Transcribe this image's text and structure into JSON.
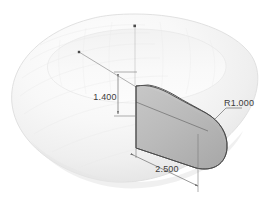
{
  "drawing": {
    "title": "Torus revolved solid with shaded sweep profile",
    "view": "isometric",
    "background_color": "#ffffff",
    "body": {
      "name": "torus",
      "fill_color": "#f7f7f7",
      "shade_light": "#fdfdfd",
      "shade_mid": "#efefef",
      "shade_dark": "#dcdcdc",
      "edge_color": "#d8d8d8"
    },
    "profile": {
      "name": "cross-section-profile",
      "fill_color": "#b9b9b9",
      "fill_light": "#c9c9c9",
      "fill_dark": "#a9a9a9",
      "edge_color": "#4a4a4a"
    },
    "annotation_color": "#6e6e6e",
    "text_color": "#3b3b3b"
  },
  "dimensions": [
    {
      "id": "height",
      "label": "1.400",
      "type": "linear-vertical",
      "description": "profile height"
    },
    {
      "id": "length",
      "label": "2.500",
      "type": "linear-diagonal",
      "description": "profile length"
    },
    {
      "id": "radius",
      "label": "R1.000",
      "type": "radial-leader",
      "description": "fillet radius on profile end"
    }
  ],
  "markers": [
    {
      "id": "origin-point",
      "name": "top-center-point"
    },
    {
      "id": "axis-point",
      "name": "axis-start-point"
    },
    {
      "id": "profile-mid-point",
      "name": "profile-center-point"
    }
  ]
}
